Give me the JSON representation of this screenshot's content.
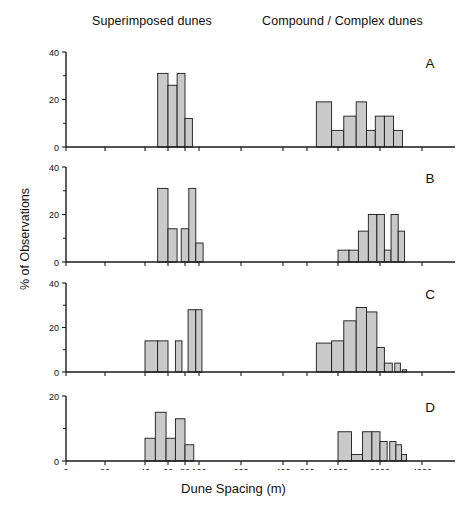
{
  "figure": {
    "header_left": "Superimposed dunes",
    "header_right": "Compound / Complex dunes",
    "ylabel": "% of Observations",
    "xlabel": "Dune Spacing (m)",
    "bar_fill": "#c9c9c9",
    "bar_stroke": "#1a1a1a",
    "axis_color": "#1a1a1a"
  },
  "chart_data": [
    {
      "type": "bar",
      "panel": "A",
      "title": "A",
      "xlabel": "Dune Spacing (m)",
      "ylabel": "% of Observations",
      "xscale": "log-broken",
      "xtick_labels": [
        "0",
        "20",
        "40",
        "60",
        "80",
        "100",
        "200",
        "400",
        "600",
        "1000",
        "2000",
        "4000"
      ],
      "xtick_values": [
        0,
        20,
        40,
        60,
        80,
        100,
        200,
        400,
        600,
        1000,
        2000,
        4000
      ],
      "ytick_labels": [
        "0",
        "20",
        "40"
      ],
      "ytick_values": [
        0,
        20,
        40
      ],
      "ylim": [
        0,
        40
      ],
      "grid": false,
      "legend": "none",
      "bins": [
        {
          "x0": 50,
          "x1": 60,
          "value": 31
        },
        {
          "x0": 60,
          "x1": 70,
          "value": 26
        },
        {
          "x0": 70,
          "x1": 80,
          "value": 31
        },
        {
          "x0": 80,
          "x1": 90,
          "value": 12
        },
        {
          "x0": 700,
          "x1": 900,
          "value": 19
        },
        {
          "x0": 900,
          "x1": 1100,
          "value": 7
        },
        {
          "x0": 1100,
          "x1": 1350,
          "value": 13
        },
        {
          "x0": 1350,
          "x1": 1600,
          "value": 19
        },
        {
          "x0": 1600,
          "x1": 1850,
          "value": 7
        },
        {
          "x0": 1850,
          "x1": 2150,
          "value": 13
        },
        {
          "x0": 2150,
          "x1": 2500,
          "value": 13
        },
        {
          "x0": 2500,
          "x1": 2900,
          "value": 7
        }
      ]
    },
    {
      "type": "bar",
      "panel": "B",
      "title": "B",
      "xlabel": "Dune Spacing (m)",
      "ylabel": "% of Observations",
      "xscale": "log-broken",
      "xtick_labels": [
        "0",
        "20",
        "40",
        "60",
        "80",
        "100",
        "200",
        "400",
        "600",
        "1000",
        "2000",
        "4000"
      ],
      "xtick_values": [
        0,
        20,
        40,
        60,
        80,
        100,
        200,
        400,
        600,
        1000,
        2000,
        4000
      ],
      "ytick_labels": [
        "0",
        "20",
        "40"
      ],
      "ytick_values": [
        0,
        20,
        40
      ],
      "ylim": [
        0,
        40
      ],
      "grid": false,
      "legend": "none",
      "bins": [
        {
          "x0": 50,
          "x1": 60,
          "value": 31
        },
        {
          "x0": 60,
          "x1": 70,
          "value": 14
        },
        {
          "x0": 75,
          "x1": 85,
          "value": 14
        },
        {
          "x0": 85,
          "x1": 95,
          "value": 31
        },
        {
          "x0": 95,
          "x1": 107,
          "value": 8
        },
        {
          "x0": 1000,
          "x1": 1200,
          "value": 5
        },
        {
          "x0": 1200,
          "x1": 1400,
          "value": 5
        },
        {
          "x0": 1400,
          "x1": 1650,
          "value": 13
        },
        {
          "x0": 1650,
          "x1": 1900,
          "value": 20
        },
        {
          "x0": 1900,
          "x1": 2150,
          "value": 20
        },
        {
          "x0": 2150,
          "x1": 2400,
          "value": 5
        },
        {
          "x0": 2400,
          "x1": 2700,
          "value": 20
        },
        {
          "x0": 2700,
          "x1": 3000,
          "value": 13
        }
      ]
    },
    {
      "type": "bar",
      "panel": "C",
      "title": "C",
      "xlabel": "Dune Spacing (m)",
      "ylabel": "% of Observations",
      "xscale": "log-broken",
      "xtick_labels": [
        "0",
        "20",
        "40",
        "60",
        "80",
        "100",
        "200",
        "400",
        "600",
        "1000",
        "2000",
        "4000"
      ],
      "xtick_values": [
        0,
        20,
        40,
        60,
        80,
        100,
        200,
        400,
        600,
        1000,
        2000,
        4000
      ],
      "ytick_labels": [
        "0",
        "20",
        "40"
      ],
      "ytick_values": [
        0,
        20,
        40
      ],
      "ylim": [
        0,
        40
      ],
      "grid": false,
      "legend": "none",
      "bins": [
        {
          "x0": 40,
          "x1": 50,
          "value": 14
        },
        {
          "x0": 50,
          "x1": 60,
          "value": 14
        },
        {
          "x0": 68,
          "x1": 76,
          "value": 14
        },
        {
          "x0": 84,
          "x1": 95,
          "value": 28
        },
        {
          "x0": 95,
          "x1": 105,
          "value": 28
        },
        {
          "x0": 700,
          "x1": 900,
          "value": 13
        },
        {
          "x0": 900,
          "x1": 1100,
          "value": 14
        },
        {
          "x0": 1100,
          "x1": 1350,
          "value": 23
        },
        {
          "x0": 1350,
          "x1": 1600,
          "value": 29
        },
        {
          "x0": 1600,
          "x1": 1900,
          "value": 27
        },
        {
          "x0": 1900,
          "x1": 2150,
          "value": 11
        },
        {
          "x0": 2150,
          "x1": 2450,
          "value": 4
        },
        {
          "x0": 2550,
          "x1": 2800,
          "value": 4
        },
        {
          "x0": 2900,
          "x1": 3100,
          "value": 1
        }
      ]
    },
    {
      "type": "bar",
      "panel": "D",
      "title": "D",
      "xlabel": "Dune Spacing (m)",
      "ylabel": "% of Observations",
      "xscale": "log-broken",
      "xtick_labels": [
        "0",
        "20",
        "40",
        "60",
        "80",
        "100",
        "200",
        "400",
        "600",
        "1000",
        "2000",
        "4000"
      ],
      "xtick_values": [
        0,
        20,
        40,
        60,
        80,
        100,
        200,
        400,
        600,
        1000,
        2000,
        4000
      ],
      "ytick_labels": [
        "0",
        "20"
      ],
      "ytick_values": [
        0,
        20
      ],
      "ylim": [
        0,
        20
      ],
      "grid": false,
      "legend": "none",
      "bins": [
        {
          "x0": 40,
          "x1": 48,
          "value": 7
        },
        {
          "x0": 48,
          "x1": 58,
          "value": 15
        },
        {
          "x0": 58,
          "x1": 68,
          "value": 7
        },
        {
          "x0": 68,
          "x1": 80,
          "value": 13
        },
        {
          "x0": 80,
          "x1": 92,
          "value": 5
        },
        {
          "x0": 1000,
          "x1": 1250,
          "value": 9
        },
        {
          "x0": 1250,
          "x1": 1500,
          "value": 2
        },
        {
          "x0": 1500,
          "x1": 1750,
          "value": 9
        },
        {
          "x0": 1750,
          "x1": 2000,
          "value": 9
        },
        {
          "x0": 2000,
          "x1": 2250,
          "value": 6
        },
        {
          "x0": 2350,
          "x1": 2600,
          "value": 6
        },
        {
          "x0": 2600,
          "x1": 2850,
          "value": 5
        },
        {
          "x0": 2850,
          "x1": 3100,
          "value": 2
        }
      ]
    }
  ]
}
